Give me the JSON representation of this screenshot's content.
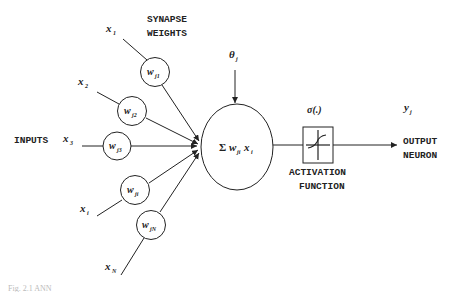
{
  "diagram": {
    "title_labels": {
      "synapse_line1": "SYNAPSE",
      "synapse_line2": "WEIGHTS",
      "inputs": "INPUTS",
      "activation_line1": "ACTIVATION",
      "activation_line2": "FUNCTION",
      "output_line1": "OUTPUT",
      "output_line2": "NEURON"
    },
    "inputs": [
      {
        "var": "x",
        "sub": "1",
        "weight": "w",
        "weight_sub": "j1"
      },
      {
        "var": "x",
        "sub": "2",
        "weight": "w",
        "weight_sub": "j2"
      },
      {
        "var": "x",
        "sub": "3",
        "weight": "w",
        "weight_sub": "j3"
      },
      {
        "var": "x",
        "sub": "i",
        "weight": "w",
        "weight_sub": "ji"
      },
      {
        "var": "x",
        "sub": "N",
        "weight": "w",
        "weight_sub": "jN"
      }
    ],
    "bias": {
      "symbol": "θ",
      "sub": "j"
    },
    "summation": {
      "sigma": "Σ",
      "w": "w",
      "w_sub": "ji",
      "x": "x",
      "x_sub": "i"
    },
    "activation": {
      "symbol": "σ(.)"
    },
    "output": {
      "var": "y",
      "sub": "j"
    },
    "caption": "Fig. 2.1 ANN"
  }
}
